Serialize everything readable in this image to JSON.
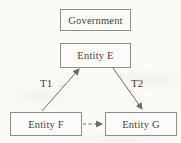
{
  "diagram": {
    "nodes": [
      {
        "id": "government",
        "label": "Government"
      },
      {
        "id": "entity-e",
        "label": "Entity E"
      },
      {
        "id": "entity-f",
        "label": "Entity F"
      },
      {
        "id": "entity-g",
        "label": "Entity G"
      }
    ],
    "edges": [
      {
        "from": "entity-f",
        "to": "entity-e",
        "label": "T1",
        "style": "solid",
        "direction": "up-right"
      },
      {
        "from": "entity-e",
        "to": "entity-g",
        "label": "T2",
        "style": "solid",
        "direction": "down-right"
      },
      {
        "from": "entity-f",
        "to": "entity-g",
        "label": "",
        "style": "dashed",
        "direction": "right"
      }
    ],
    "colors": {
      "background": "#fbfaf7",
      "box_border": "#8d8d8a",
      "text": "#45413a",
      "arrow": "#6b6a66"
    }
  }
}
